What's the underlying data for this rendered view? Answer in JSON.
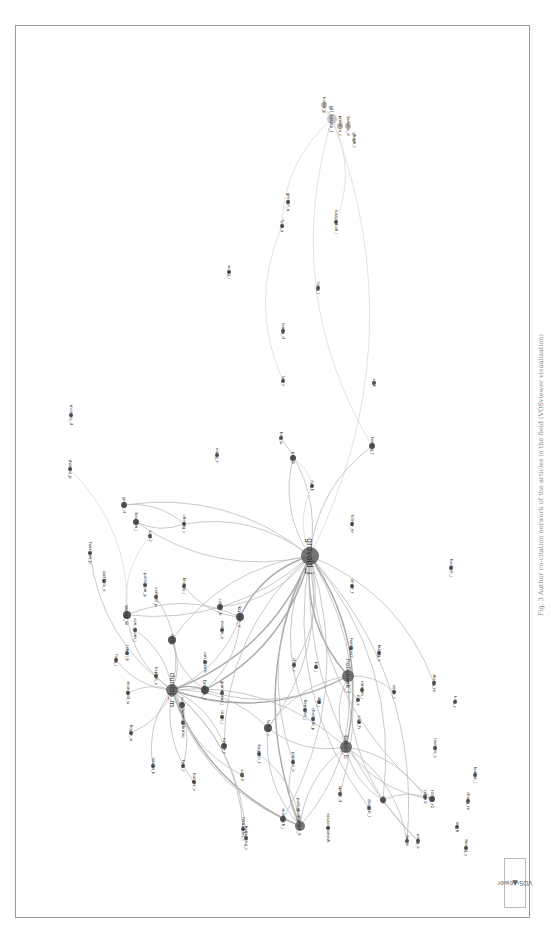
{
  "figure": {
    "caption": "Fig. 3 Author co-citation network of the articles in the field (VOSviewer visualization)",
    "logo": "VOSviewer",
    "orientation": "rotated 90° counter-clockwise"
  },
  "network": {
    "nodes": [
      {
        "id": "n1",
        "label": "grovold_j",
        "x": 310,
        "y": 556,
        "r": 9,
        "fs": 8
      },
      {
        "id": "n2",
        "label": "dunlop_m",
        "x": 172,
        "y": 690,
        "r": 6,
        "fs": 7
      },
      {
        "id": "n3",
        "label": "hollebeek_l",
        "x": 348,
        "y": 676,
        "r": 6,
        "fs": 6
      },
      {
        "id": "n4",
        "label": "babin_b",
        "x": 346,
        "y": 747,
        "r": 6,
        "fs": 6
      },
      {
        "id": "n5",
        "label": "vargo_s",
        "x": 300,
        "y": 826,
        "r": 5,
        "fs": 5
      },
      {
        "id": "n6",
        "label": "brodie_r",
        "x": 205,
        "y": 690,
        "r": 4,
        "fs": 5
      },
      {
        "id": "n7",
        "label": "kumar_v",
        "x": 240,
        "y": 617,
        "r": 4,
        "fs": 5
      },
      {
        "id": "n8",
        "label": "wang_w",
        "x": 127,
        "y": 615,
        "r": 4,
        "fs": 5
      },
      {
        "id": "n9",
        "label": "hair_j",
        "x": 172,
        "y": 640,
        "r": 4,
        "fs": 4
      },
      {
        "id": "n10",
        "label": "fornell_c",
        "x": 268,
        "y": 728,
        "r": 4,
        "fs": 4
      },
      {
        "id": "n11",
        "label": "gil_saura_i",
        "x": 332,
        "y": 119,
        "r": 5,
        "fs": 5,
        "light": true
      },
      {
        "id": "n12",
        "label": "kotler_p",
        "x": 324,
        "y": 105,
        "r": 3,
        "fs": 4,
        "light": true
      },
      {
        "id": "n13",
        "label": "prentice_c",
        "x": 340,
        "y": 126,
        "r": 3,
        "fs": 4,
        "light": true
      },
      {
        "id": "n14",
        "label": "buhalis_d",
        "x": 348,
        "y": 126,
        "r": 3,
        "fs": 4,
        "light": true
      },
      {
        "id": "n15",
        "label": "ghosh_t",
        "x": 354,
        "y": 140,
        "r": 2,
        "fs": 4,
        "light": true
      },
      {
        "id": "n16",
        "label": "fyall_a",
        "x": 282,
        "y": 226,
        "r": 2,
        "fs": 4
      },
      {
        "id": "n17",
        "label": "gretzel_u",
        "x": 288,
        "y": 202,
        "r": 2,
        "fs": 4
      },
      {
        "id": "n18",
        "label": "tussyadiah_i",
        "x": 336,
        "y": 222,
        "r": 2,
        "fs": 4
      },
      {
        "id": "n19",
        "label": "wong_i",
        "x": 229,
        "y": 272,
        "r": 2,
        "fs": 4
      },
      {
        "id": "n20",
        "label": "liang_l",
        "x": 318,
        "y": 288,
        "r": 2,
        "fs": 4
      },
      {
        "id": "n21",
        "label": "leung_d",
        "x": 283,
        "y": 331,
        "r": 2,
        "fs": 4
      },
      {
        "id": "n22",
        "label": "law_r",
        "x": 283,
        "y": 381,
        "r": 2,
        "fs": 4
      },
      {
        "id": "n23",
        "label": "so_k",
        "x": 374,
        "y": 383,
        "r": 2,
        "fs": 4
      },
      {
        "id": "n24",
        "label": "kim_w",
        "x": 281,
        "y": 438,
        "r": 2,
        "fs": 4
      },
      {
        "id": "n25",
        "label": "pan_b",
        "x": 293,
        "y": 458,
        "r": 3,
        "fs": 4
      },
      {
        "id": "n26",
        "label": "hennig_t",
        "x": 372,
        "y": 446,
        "r": 3,
        "fs": 4
      },
      {
        "id": "n27",
        "label": "xiang_z",
        "x": 217,
        "y": 455,
        "r": 2,
        "fs": 4
      },
      {
        "id": "n28",
        "label": "ryu_k",
        "x": 312,
        "y": 486,
        "r": 2,
        "fs": 4
      },
      {
        "id": "n29",
        "label": "bitner_m",
        "x": 352,
        "y": 524,
        "r": 2,
        "fs": 4
      },
      {
        "id": "n30",
        "label": "heskett_j",
        "x": 451,
        "y": 568,
        "r": 2,
        "fs": 4
      },
      {
        "id": "n31",
        "label": "oliver_r",
        "x": 352,
        "y": 586,
        "r": 2,
        "fs": 4
      },
      {
        "id": "n32",
        "label": "sharma_p",
        "x": 70,
        "y": 469,
        "r": 2,
        "fs": 4
      },
      {
        "id": "n33",
        "label": "grace_d",
        "x": 124,
        "y": 505,
        "r": 3,
        "fs": 4
      },
      {
        "id": "n34",
        "label": "bowden_j",
        "x": 136,
        "y": 522,
        "r": 3,
        "fs": 4
      },
      {
        "id": "n35",
        "label": "so_k2",
        "x": 150,
        "y": 536,
        "r": 2,
        "fs": 4
      },
      {
        "id": "n36",
        "label": "cheung_c",
        "x": 184,
        "y": 524,
        "r": 2,
        "fs": 4
      },
      {
        "id": "n37",
        "label": "harrigan_p",
        "x": 90,
        "y": 553,
        "r": 2,
        "fs": 4
      },
      {
        "id": "n38",
        "label": "jaakkola_e",
        "x": 104,
        "y": 581,
        "r": 2,
        "fs": 4
      },
      {
        "id": "n39",
        "label": "brakus_j",
        "x": 184,
        "y": 586,
        "r": 2,
        "fs": 4
      },
      {
        "id": "n40",
        "label": "patterson_p",
        "x": 145,
        "y": 585,
        "r": 2,
        "fs": 4
      },
      {
        "id": "n41",
        "label": "verhoef_p",
        "x": 156,
        "y": 597,
        "r": 2,
        "fs": 4
      },
      {
        "id": "n42",
        "label": "calder_b",
        "x": 220,
        "y": 607,
        "r": 3,
        "fs": 4
      },
      {
        "id": "n43",
        "label": "mollen_a",
        "x": 222,
        "y": 630,
        "r": 2,
        "fs": 4
      },
      {
        "id": "n44",
        "label": "van_doorn_j",
        "x": 135,
        "y": 630,
        "r": 2,
        "fs": 4
      },
      {
        "id": "n45",
        "label": "fang_j",
        "x": 116,
        "y": 660,
        "r": 2,
        "fs": 4
      },
      {
        "id": "n46",
        "label": "taheri_b",
        "x": 127,
        "y": 653,
        "r": 2,
        "fs": 4
      },
      {
        "id": "n47",
        "label": "kaplan_a",
        "x": 156,
        "y": 676,
        "r": 2,
        "fs": 4
      },
      {
        "id": "n48",
        "label": "mangold_w",
        "x": 128,
        "y": 693,
        "r": 2,
        "fs": 4
      },
      {
        "id": "n49",
        "label": "hoyer_w",
        "x": 131,
        "y": 733,
        "r": 2,
        "fs": 4
      },
      {
        "id": "n50",
        "label": "leckie_c",
        "x": 182,
        "y": 705,
        "r": 3,
        "fs": 4
      },
      {
        "id": "n51",
        "label": "hennig_thurau",
        "x": 183,
        "y": 723,
        "r": 2,
        "fs": 4
      },
      {
        "id": "n52",
        "label": "lemon_k",
        "x": 153,
        "y": 766,
        "r": 2,
        "fs": 4
      },
      {
        "id": "n53",
        "label": "hsu_c",
        "x": 183,
        "y": 766,
        "r": 2,
        "fs": 4
      },
      {
        "id": "n54",
        "label": "barger_v",
        "x": 194,
        "y": 782,
        "r": 2,
        "fs": 4
      },
      {
        "id": "n55",
        "label": "van_doorn",
        "x": 205,
        "y": 662,
        "r": 2,
        "fs": 4
      },
      {
        "id": "n56",
        "label": "gummerus_j",
        "x": 222,
        "y": 693,
        "r": 2,
        "fs": 4
      },
      {
        "id": "n57",
        "label": "islam_j",
        "x": 222,
        "y": 717,
        "r": 2,
        "fs": 4
      },
      {
        "id": "n58",
        "label": "rather_r",
        "x": 224,
        "y": 746,
        "r": 3,
        "fs": 4
      },
      {
        "id": "n59",
        "label": "so_k3",
        "x": 242,
        "y": 775,
        "r": 2,
        "fs": 4
      },
      {
        "id": "n60",
        "label": "bagozzi_r",
        "x": 259,
        "y": 754,
        "r": 2,
        "fs": 4
      },
      {
        "id": "n61",
        "label": "harmeling_c",
        "x": 246,
        "y": 838,
        "r": 2,
        "fs": 4
      },
      {
        "id": "n62",
        "label": "marbach_j",
        "x": 283,
        "y": 819,
        "r": 3,
        "fs": 4
      },
      {
        "id": "n63",
        "label": "podsakoff_p",
        "x": 298,
        "y": 810,
        "r": 2,
        "fs": 4,
        "light": true
      },
      {
        "id": "n64",
        "label": "rasoolimanesh",
        "x": 328,
        "y": 828,
        "r": 2,
        "fs": 4
      },
      {
        "id": "n65",
        "label": "henseler_j",
        "x": 305,
        "y": 710,
        "r": 2,
        "fs": 4
      },
      {
        "id": "n66",
        "label": "chen_c",
        "x": 294,
        "y": 665,
        "r": 2,
        "fs": 4
      },
      {
        "id": "n67",
        "label": "kim_j",
        "x": 316,
        "y": 667,
        "r": 2,
        "fs": 4
      },
      {
        "id": "n68",
        "label": "pansari_a",
        "x": 293,
        "y": 762,
        "r": 2,
        "fs": 4
      },
      {
        "id": "n69",
        "label": "chathoth_p",
        "x": 313,
        "y": 719,
        "r": 2,
        "fs": 4
      },
      {
        "id": "n70",
        "label": "ahn_j",
        "x": 319,
        "y": 702,
        "r": 2,
        "fs": 4
      },
      {
        "id": "n71",
        "label": "sprott_d",
        "x": 340,
        "y": 794,
        "r": 2,
        "fs": 4
      },
      {
        "id": "n72",
        "label": "harrigan2",
        "x": 351,
        "y": 648,
        "r": 2,
        "fs": 4
      },
      {
        "id": "n73",
        "label": "roy_s",
        "x": 358,
        "y": 700,
        "r": 2,
        "fs": 4
      },
      {
        "id": "n74",
        "label": "romero_j",
        "x": 362,
        "y": 690,
        "r": 2,
        "fs": 4
      },
      {
        "id": "n75",
        "label": "so_k_h",
        "x": 359,
        "y": 722,
        "r": 2,
        "fs": 4
      },
      {
        "id": "n76",
        "label": "sashi_c",
        "x": 394,
        "y": 692,
        "r": 2,
        "fs": 4
      },
      {
        "id": "n77",
        "label": "huang_s",
        "x": 379,
        "y": 653,
        "r": 2,
        "fs": 4
      },
      {
        "id": "n78",
        "label": "dessart_l",
        "x": 369,
        "y": 808,
        "r": 2,
        "fs": 4
      },
      {
        "id": "n79",
        "label": "li_m",
        "x": 383,
        "y": 800,
        "r": 3,
        "fs": 4
      },
      {
        "id": "n80",
        "label": "loureiro_s",
        "x": 435,
        "y": 748,
        "r": 2,
        "fs": 4
      },
      {
        "id": "n81",
        "label": "taheri2",
        "x": 425,
        "y": 797,
        "r": 2,
        "fs": 4
      },
      {
        "id": "n82",
        "label": "rather_r2",
        "x": 432,
        "y": 799,
        "r": 3,
        "fs": 4
      },
      {
        "id": "n83",
        "label": "hu_m",
        "x": 407,
        "y": 841,
        "r": 2,
        "fs": 4
      },
      {
        "id": "n84",
        "label": "wong_a",
        "x": 418,
        "y": 841,
        "r": 2,
        "fs": 4
      },
      {
        "id": "n85",
        "label": "zhang_m",
        "x": 434,
        "y": 683,
        "r": 2,
        "fs": 4
      },
      {
        "id": "n86",
        "label": "kim_y",
        "x": 455,
        "y": 702,
        "r": 2,
        "fs": 4
      },
      {
        "id": "n87",
        "label": "lee_h",
        "x": 457,
        "y": 827,
        "r": 2,
        "fs": 4
      },
      {
        "id": "n88",
        "label": "cheng_m",
        "x": 468,
        "y": 801,
        "r": 2,
        "fs": 4
      },
      {
        "id": "n89",
        "label": "kumar_j",
        "x": 475,
        "y": 775,
        "r": 2,
        "fs": 4
      },
      {
        "id": "n90",
        "label": "huang_y",
        "x": 466,
        "y": 848,
        "r": 2,
        "fs": 4
      },
      {
        "id": "n91",
        "label": "mcevoy_d",
        "x": 71,
        "y": 415,
        "r": 2,
        "fs": 4
      },
      {
        "id": "n92",
        "label": "fernandes_t",
        "x": 243,
        "y": 829,
        "r": 2,
        "fs": 4
      }
    ],
    "edges": [
      [
        "n1",
        "n2",
        "strong"
      ],
      [
        "n1",
        "n3",
        "strong"
      ],
      [
        "n1",
        "n4",
        "strong"
      ],
      [
        "n1",
        "n5",
        "strong"
      ],
      [
        "n1",
        "n6",
        "strong"
      ],
      [
        "n1",
        "n7",
        "strong"
      ],
      [
        "n1",
        "n8",
        ""
      ],
      [
        "n1",
        "n9",
        ""
      ],
      [
        "n1",
        "n10",
        ""
      ],
      [
        "n1",
        "n11",
        "faint"
      ],
      [
        "n1",
        "n25",
        ""
      ],
      [
        "n1",
        "n24",
        ""
      ],
      [
        "n1",
        "n26",
        ""
      ],
      [
        "n1",
        "n33",
        ""
      ],
      [
        "n1",
        "n34",
        ""
      ],
      [
        "n1",
        "n36",
        ""
      ],
      [
        "n1",
        "n42",
        ""
      ],
      [
        "n1",
        "n58",
        ""
      ],
      [
        "n1",
        "n62",
        ""
      ],
      [
        "n1",
        "n65",
        ""
      ],
      [
        "n1",
        "n66",
        ""
      ],
      [
        "n1",
        "n68",
        ""
      ],
      [
        "n1",
        "n71",
        ""
      ],
      [
        "n1",
        "n78",
        ""
      ],
      [
        "n1",
        "n79",
        ""
      ],
      [
        "n1",
        "n82",
        ""
      ],
      [
        "n1",
        "n83",
        ""
      ],
      [
        "n1",
        "n84",
        ""
      ],
      [
        "n1",
        "n85",
        ""
      ],
      [
        "n2",
        "n3",
        "strong"
      ],
      [
        "n2",
        "n4",
        ""
      ],
      [
        "n2",
        "n5",
        "strong"
      ],
      [
        "n2",
        "n6",
        "strong"
      ],
      [
        "n2",
        "n7",
        ""
      ],
      [
        "n2",
        "n8",
        ""
      ],
      [
        "n2",
        "n9",
        ""
      ],
      [
        "n2",
        "n10",
        ""
      ],
      [
        "n2",
        "n44",
        ""
      ],
      [
        "n2",
        "n45",
        ""
      ],
      [
        "n2",
        "n48",
        ""
      ],
      [
        "n2",
        "n49",
        ""
      ],
      [
        "n2",
        "n50",
        ""
      ],
      [
        "n2",
        "n51",
        ""
      ],
      [
        "n2",
        "n52",
        ""
      ],
      [
        "n2",
        "n53",
        ""
      ],
      [
        "n2",
        "n54",
        ""
      ],
      [
        "n2",
        "n58",
        ""
      ],
      [
        "n2",
        "n59",
        ""
      ],
      [
        "n2",
        "n61",
        ""
      ],
      [
        "n2",
        "n62",
        ""
      ],
      [
        "n2",
        "n92",
        ""
      ],
      [
        "n2",
        "n41",
        ""
      ],
      [
        "n2",
        "n37",
        ""
      ],
      [
        "n3",
        "n4",
        ""
      ],
      [
        "n3",
        "n5",
        ""
      ],
      [
        "n3",
        "n10",
        ""
      ],
      [
        "n3",
        "n6",
        ""
      ],
      [
        "n3",
        "n73",
        ""
      ],
      [
        "n3",
        "n76",
        ""
      ],
      [
        "n4",
        "n5",
        ""
      ],
      [
        "n4",
        "n10",
        ""
      ],
      [
        "n4",
        "n79",
        ""
      ],
      [
        "n4",
        "n81",
        ""
      ],
      [
        "n4",
        "n82",
        ""
      ],
      [
        "n5",
        "n10",
        ""
      ],
      [
        "n5",
        "n60",
        ""
      ],
      [
        "n5",
        "n68",
        ""
      ],
      [
        "n6",
        "n7",
        ""
      ],
      [
        "n6",
        "n9",
        ""
      ],
      [
        "n7",
        "n8",
        ""
      ],
      [
        "n7",
        "n39",
        ""
      ],
      [
        "n11",
        "n16",
        "faint"
      ],
      [
        "n11",
        "n18",
        "faint"
      ],
      [
        "n11",
        "n26",
        "faint"
      ],
      [
        "n11",
        "n12",
        "faint"
      ],
      [
        "n11",
        "n13",
        "faint"
      ],
      [
        "n11",
        "n14",
        "faint"
      ],
      [
        "n16",
        "n22",
        "faint"
      ],
      [
        "n25",
        "n28",
        "faint"
      ],
      [
        "n28",
        "n1",
        "faint"
      ],
      [
        "n33",
        "n36",
        ""
      ],
      [
        "n34",
        "n36",
        ""
      ],
      [
        "n32",
        "n8",
        "faint"
      ],
      [
        "n35",
        "n8",
        "faint"
      ],
      [
        "n79",
        "n82",
        ""
      ],
      [
        "n83",
        "n4",
        ""
      ],
      [
        "n84",
        "n3",
        ""
      ]
    ]
  }
}
